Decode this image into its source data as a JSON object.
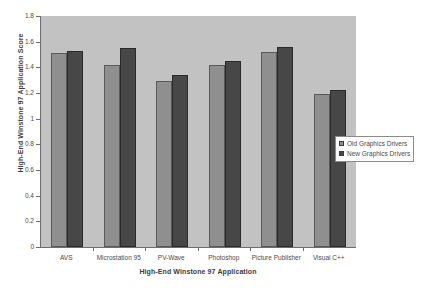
{
  "chart_data": {
    "type": "bar",
    "title": "",
    "xlabel": "High-End Winstone 97 Application",
    "ylabel": "High-End Winstone 97 Application Score",
    "ylim": [
      0,
      1.8
    ],
    "ytick_step": 0.2,
    "yticks": [
      "0",
      "0.2",
      "0.4",
      "0.6",
      "0.8",
      "1",
      "1.2",
      "1.4",
      "1.6",
      "1.8"
    ],
    "grid": false,
    "legend_position": "right-middle",
    "categories": [
      "AVS",
      "Microstation 95",
      "PV-Wave",
      "Photoshop",
      "Picture Publisher",
      "Visual C++"
    ],
    "series": [
      {
        "name": "Old Graphics Drivers",
        "color": "#8f8f8f",
        "values": [
          1.51,
          1.42,
          1.29,
          1.42,
          1.52,
          1.19
        ]
      },
      {
        "name": "New Graphics Drivers",
        "color": "#474747",
        "values": [
          1.53,
          1.55,
          1.34,
          1.45,
          1.56,
          1.22
        ]
      }
    ]
  },
  "legend": {
    "items": [
      {
        "label": "Old Graphics Drivers",
        "color": "#8f8f8f"
      },
      {
        "label": "New Graphics Drivers",
        "color": "#474747"
      }
    ]
  },
  "colors": {
    "plot_background": "#c2c2c2",
    "page_background": "#ffffff",
    "axis": "#6d6d6d",
    "text": "#4a4a4a",
    "series_old": "#8f8f8f",
    "series_new": "#474747"
  }
}
